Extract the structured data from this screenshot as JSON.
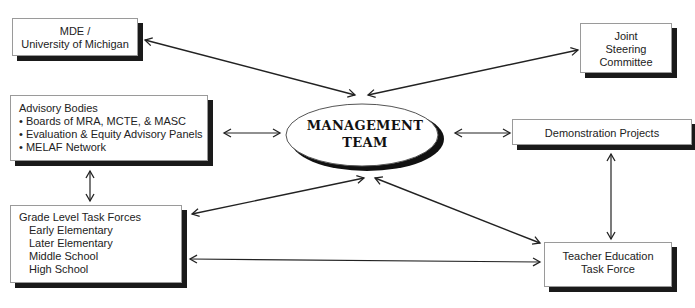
{
  "nodes": {
    "management_team": {
      "lines": [
        "MANAGEMENT",
        "TEAM"
      ]
    },
    "mde": {
      "lines": [
        "MDE /",
        "University of Michigan"
      ]
    },
    "joint_steering": {
      "lines": [
        "Joint",
        "Steering",
        "Committee"
      ]
    },
    "advisory_bodies": {
      "title": "Advisory Bodies",
      "items": [
        "• Boards of MRA, MCTE, & MASC",
        "• Evaluation & Equity Advisory Panels",
        "• MELAF Network"
      ]
    },
    "demonstration_projects": {
      "label": "Demonstration Projects"
    },
    "grade_level": {
      "title": "Grade Level Task Forces",
      "items": [
        "Early Elementary",
        "Later Elementary",
        "Middle School",
        "High School"
      ]
    },
    "teacher_education": {
      "lines": [
        "Teacher Education",
        "Task Force"
      ]
    }
  },
  "edges": [
    {
      "from": "management_team",
      "to": "mde",
      "type": "bidirectional"
    },
    {
      "from": "management_team",
      "to": "joint_steering",
      "type": "bidirectional"
    },
    {
      "from": "management_team",
      "to": "advisory_bodies",
      "type": "bidirectional"
    },
    {
      "from": "management_team",
      "to": "demonstration_projects",
      "type": "bidirectional"
    },
    {
      "from": "management_team",
      "to": "grade_level",
      "type": "bidirectional"
    },
    {
      "from": "management_team",
      "to": "teacher_education",
      "type": "bidirectional"
    },
    {
      "from": "advisory_bodies",
      "to": "grade_level",
      "type": "bidirectional"
    },
    {
      "from": "demonstration_projects",
      "to": "teacher_education",
      "type": "bidirectional"
    },
    {
      "from": "grade_level",
      "to": "teacher_education",
      "type": "bidirectional"
    }
  ]
}
